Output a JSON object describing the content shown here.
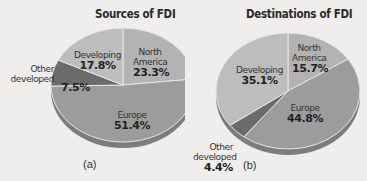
{
  "chart_data": [
    {
      "type": "pie",
      "title": "Sources of FDI",
      "panel_label": "(a)",
      "categories": [
        "North America",
        "Europe",
        "Other developed",
        "Developing"
      ],
      "values": [
        23.3,
        51.4,
        7.5,
        17.8
      ],
      "unit": "%",
      "colors": [
        "#b3b3b3",
        "#9c9c9c",
        "#6b6b6b",
        "#bdbdbd"
      ]
    },
    {
      "type": "pie",
      "title": "Destinations of FDI",
      "panel_label": "(b)",
      "categories": [
        "North America",
        "Europe",
        "Other developed",
        "Developing"
      ],
      "values": [
        15.7,
        44.8,
        4.4,
        35.1
      ],
      "unit": "%",
      "colors": [
        "#b3b3b3",
        "#9c9c9c",
        "#6b6b6b",
        "#bdbdbd"
      ]
    }
  ],
  "labels": {
    "a": {
      "title": "Sources of FDI",
      "panel": "(a)",
      "north_america": "North America",
      "north_america_value": "23.3%",
      "europe": "Europe",
      "europe_value": "51.4%",
      "other_developed": "Other developed",
      "other_developed_value": "7.5%",
      "developing": "Developing",
      "developing_value": "17.8%"
    },
    "b": {
      "title": "Destinations of FDI",
      "panel": "(b)",
      "north_america": "North America",
      "north_america_value": "15.7%",
      "europe": "Europe",
      "europe_value": "44.8%",
      "other_developed": "Other developed",
      "other_developed_value": "4.4%",
      "developing": "Developing",
      "developing_value": "35.1%"
    }
  }
}
